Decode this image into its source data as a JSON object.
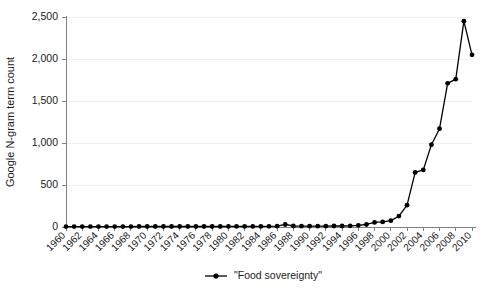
{
  "chart_data": {
    "type": "line",
    "title": "",
    "xlabel": "",
    "ylabel": "Google N-gram term count",
    "ylim": [
      0,
      2500
    ],
    "xlim": [
      1960,
      2010
    ],
    "grid": true,
    "legend_position": "bottom-center",
    "y_ticks": [
      0,
      500,
      1000,
      1500,
      2000,
      2500
    ],
    "y_tick_labels": [
      "0",
      "500",
      "1,000",
      "1,500",
      "2,000",
      "2,500"
    ],
    "x_ticks": [
      1960,
      1962,
      1964,
      1966,
      1968,
      1970,
      1972,
      1974,
      1976,
      1978,
      1980,
      1982,
      1984,
      1986,
      1988,
      1990,
      1992,
      1994,
      1996,
      1998,
      2000,
      2002,
      2004,
      2006,
      2008,
      2010
    ],
    "x_tick_labels": [
      "1960",
      "1962",
      "1964",
      "1966",
      "1968",
      "1970",
      "1972",
      "1974",
      "1976",
      "1978",
      "1980",
      "1982",
      "1984",
      "1986",
      "1988",
      "1990",
      "1992",
      "1994",
      "1996",
      "1998",
      "2000",
      "2002",
      "2004",
      "2006",
      "2008",
      "2010"
    ],
    "series": [
      {
        "name": "\"Food sovereignty\"",
        "marker": "filled-circle",
        "color": "#000000",
        "x": [
          1960,
          1961,
          1962,
          1963,
          1964,
          1965,
          1966,
          1967,
          1968,
          1969,
          1970,
          1971,
          1972,
          1973,
          1974,
          1975,
          1976,
          1977,
          1978,
          1979,
          1980,
          1981,
          1982,
          1983,
          1984,
          1985,
          1986,
          1987,
          1988,
          1989,
          1990,
          1991,
          1992,
          1993,
          1994,
          1995,
          1996,
          1997,
          1998,
          1999,
          2000,
          2001,
          2002,
          2003,
          2004,
          2005,
          2006,
          2007,
          2008,
          2009,
          2010
        ],
        "values": [
          5,
          5,
          5,
          5,
          5,
          5,
          5,
          5,
          5,
          6,
          6,
          6,
          6,
          6,
          6,
          6,
          6,
          6,
          6,
          6,
          7,
          7,
          7,
          7,
          7,
          8,
          10,
          30,
          12,
          10,
          10,
          10,
          10,
          12,
          12,
          14,
          20,
          30,
          55,
          60,
          75,
          130,
          260,
          650,
          680,
          980,
          1170,
          1710,
          1760,
          2450,
          2050
        ]
      }
    ]
  },
  "legend": {
    "entries": [
      {
        "label": "\"Food sovereignty\""
      }
    ]
  }
}
